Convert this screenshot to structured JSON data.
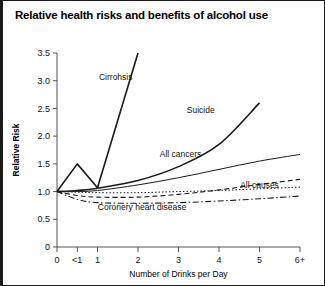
{
  "chart_data": {
    "type": "line",
    "title": "Relative health risks and benefits of alcohol use",
    "xlabel": "Number of Drinks per Day",
    "ylabel": "Relative Risk",
    "x_tick_labels": [
      "0",
      "<1",
      "1",
      "2",
      "3",
      "4",
      "5",
      "6+"
    ],
    "x_tick_values": [
      0,
      0.5,
      1,
      2,
      3,
      4,
      5,
      6
    ],
    "y_tick_labels": [
      "0",
      "0.5",
      "1.0",
      "1.5",
      "2.0",
      "2.5",
      "3.0",
      "3.5"
    ],
    "y_tick_values": [
      0,
      0.5,
      1.0,
      1.5,
      2.0,
      2.5,
      3.0,
      3.5
    ],
    "xlim": [
      0,
      6
    ],
    "ylim": [
      0,
      3.5
    ],
    "grid": false,
    "legend_position": "inline-labels",
    "series": [
      {
        "name": "Cirrohsis",
        "label": "Cirrohsis",
        "style": "solid",
        "color": "#1a1a1a",
        "width": 1.6,
        "label_x": 1.45,
        "label_y": 3.02,
        "x": [
          0,
          0.5,
          1,
          2
        ],
        "values": [
          1.0,
          1.5,
          1.07,
          3.5
        ]
      },
      {
        "name": "Suicide",
        "label": "Suicide",
        "style": "solid",
        "color": "#1a1a1a",
        "width": 1.6,
        "label_x": 3.55,
        "label_y": 2.42,
        "curve": "smooth",
        "x": [
          0,
          0.5,
          1,
          2,
          3,
          4,
          5
        ],
        "values": [
          1.0,
          1.02,
          1.06,
          1.2,
          1.45,
          1.85,
          2.6
        ]
      },
      {
        "name": "All cancers",
        "label": "All cancers",
        "style": "solid",
        "color": "#444444",
        "width": 1.0,
        "label_x": 3.05,
        "label_y": 1.62,
        "curve": "smooth",
        "x": [
          0,
          0.5,
          1,
          2,
          3,
          4,
          5,
          6
        ],
        "values": [
          1.0,
          1.0,
          1.02,
          1.12,
          1.25,
          1.4,
          1.55,
          1.67
        ]
      },
      {
        "name": "All causes",
        "label": "All causes",
        "style": "dashed",
        "color": "#333333",
        "width": 1.1,
        "label_x": 5.0,
        "label_y": 1.07,
        "curve": "smooth",
        "x": [
          0,
          0.5,
          1,
          2,
          3,
          4,
          5,
          6
        ],
        "values": [
          1.0,
          0.93,
          0.9,
          0.9,
          0.95,
          1.03,
          1.13,
          1.22
        ]
      },
      {
        "name": "All causes dotted",
        "label": "",
        "style": "dotted",
        "color": "#333333",
        "width": 1.0,
        "label_x": null,
        "label_y": null,
        "curve": "smooth",
        "x": [
          0,
          0.5,
          1,
          2,
          3,
          4,
          5,
          6
        ],
        "values": [
          1.0,
          0.99,
          0.98,
          0.98,
          1.0,
          1.02,
          1.05,
          1.08
        ]
      },
      {
        "name": "Coronery heart disease",
        "label": "Coronery heart disease",
        "style": "dashdot",
        "color": "#333333",
        "width": 1.1,
        "label_x": 2.1,
        "label_y": 0.66,
        "curve": "smooth",
        "x": [
          0,
          0.5,
          1,
          2,
          3,
          4,
          5,
          6
        ],
        "values": [
          1.0,
          0.86,
          0.8,
          0.79,
          0.8,
          0.83,
          0.87,
          0.92
        ]
      }
    ]
  }
}
